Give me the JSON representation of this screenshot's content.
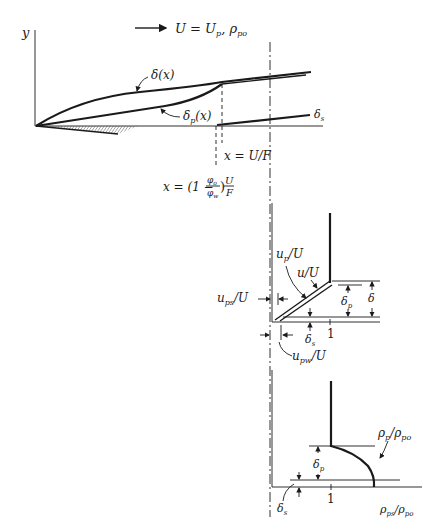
{
  "top": {
    "y_axis_label": "y",
    "flow_label": "U = U",
    "flow_label_sub_p": "p",
    "flow_label_rho": ", ρ",
    "flow_label_rho_sub": "po",
    "delta_label": "δ(x)",
    "delta_p_label": "δ",
    "delta_p_sub": "p",
    "delta_p_arg": "(x)",
    "delta_s_label": "δ",
    "delta_s_sub": "s",
    "x_uf_label": "x = U/F",
    "x_phi_label_prefix": "x = (1 −",
    "x_phi_num": "φ",
    "x_phi_num_sub": "o",
    "x_phi_den": "φ",
    "x_phi_den_sub": "w",
    "x_phi_close": ")",
    "x_phi_frac_num": "U",
    "x_phi_frac_den": "F"
  },
  "velocity_profile": {
    "up_label": "u",
    "up_sub": "p",
    "up_tail": "/U",
    "u_label": "u/U",
    "ups_label": "u",
    "ups_sub": "ps",
    "ups_tail": "/U",
    "upw_label": "u",
    "upw_sub": "pw",
    "upw_tail": "/U",
    "delta_label": "δ",
    "delta_p_label": "δ",
    "delta_p_sub": "p",
    "delta_s_label": "δ",
    "delta_s_sub": "s",
    "tick_one": "1"
  },
  "density_profile": {
    "rho_label": "ρ",
    "rho_sub": "p",
    "rho_tail": "/ρ",
    "rho_tail_sub": "po",
    "delta_p_label": "δ",
    "delta_p_sub": "p",
    "delta_s_label": "δ",
    "delta_s_sub": "s",
    "tick_one": "1",
    "axis_label": "ρ",
    "axis_label_sub": "ps",
    "axis_label_tail": "/ρ",
    "axis_label_tail_sub": "po"
  }
}
